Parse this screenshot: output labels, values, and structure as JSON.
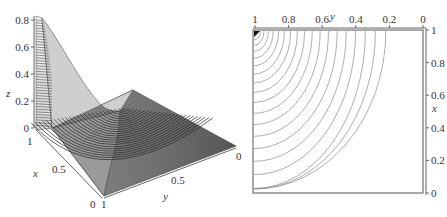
{
  "chart_data": [
    {
      "type": "surface3d",
      "title": "",
      "xlabel": "x",
      "ylabel": "y",
      "zlabel": "z",
      "z_ticks": [
        "0",
        "0.2",
        "0.4",
        "0.6",
        "0.8"
      ],
      "x_ticks": [
        "1",
        "0.5",
        "0"
      ],
      "y_ticks": [
        "1",
        "0.5",
        "0"
      ],
      "zlim": [
        0,
        0.85
      ],
      "xlim": [
        0,
        1
      ],
      "ylim": [
        0,
        1
      ],
      "description": "Surface peaking at z≈0.85 near x=1, y=1 corner, decaying toward 0; drawn with dense contour lines, grey shading",
      "peak": {
        "x": 1,
        "y": 1,
        "z": 0.85
      }
    },
    {
      "type": "contour",
      "title": "",
      "xlabel": "x",
      "ylabel": "y",
      "y_ticks_top": [
        "1",
        "0.8",
        "0.6",
        "0.4",
        "0.2",
        "0"
      ],
      "x_ticks_right": [
        "1",
        "0.8",
        "0.6",
        "0.4",
        "0.2",
        "0"
      ],
      "xlim": [
        0,
        1
      ],
      "ylim": [
        0,
        1
      ],
      "n_levels": 20,
      "description": "Concentric elliptical contour arcs centred at the (x=1, y=1) corner (top-left), densest near the corner"
    }
  ],
  "left_plot": {
    "z_label": "z",
    "x_label": "x",
    "y_label": "y",
    "z_ticks": [
      "0.8",
      "0.6",
      "0.4",
      "0.2",
      "0"
    ],
    "x_ticks": [
      "1",
      "0.5",
      "0"
    ],
    "y_ticks": [
      "1",
      "0.5",
      "0"
    ]
  },
  "right_plot": {
    "top_label": "y",
    "right_label": "x",
    "top_ticks": [
      "1",
      "0.8",
      "0.6",
      "0.4",
      "0.2",
      "0"
    ],
    "right_ticks": [
      "1",
      "0.8",
      "0.6",
      "0.4",
      "0.2",
      "0"
    ]
  }
}
